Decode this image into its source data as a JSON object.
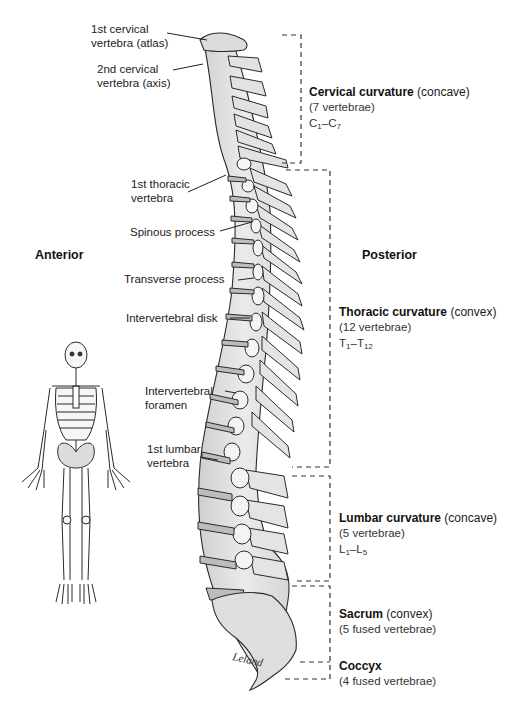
{
  "figure": {
    "orientation": {
      "left": "Anterior",
      "right": "Posterior"
    },
    "signature": "Leland",
    "left_labels": [
      {
        "id": "atlas",
        "lines": [
          "1st cervical",
          "vertebra (atlas)"
        ]
      },
      {
        "id": "axis",
        "lines": [
          "2nd cervical",
          "vertebra (axis)"
        ]
      },
      {
        "id": "first-thoracic",
        "lines": [
          "1st thoracic",
          "vertebra"
        ]
      },
      {
        "id": "spinous-process",
        "lines": [
          "Spinous process"
        ]
      },
      {
        "id": "transverse-process",
        "lines": [
          "Transverse process"
        ]
      },
      {
        "id": "intervertebral-disk",
        "lines": [
          "Intervertebral disk"
        ]
      },
      {
        "id": "intervertebral-foramen",
        "lines": [
          "Intervertebral",
          "foramen"
        ]
      },
      {
        "id": "first-lumbar",
        "lines": [
          "1st lumbar",
          "vertebra"
        ]
      }
    ],
    "regions": [
      {
        "id": "cervical",
        "name": "Cervical curvature",
        "qualifier": " (concave)",
        "count": "(7 vertebrae)",
        "range_letter": "C",
        "range_start": "1",
        "range_end": "7"
      },
      {
        "id": "thoracic",
        "name": "Thoracic curvature",
        "qualifier": " (convex)",
        "count": "(12 vertebrae)",
        "range_letter": "T",
        "range_start": "1",
        "range_end": "12"
      },
      {
        "id": "lumbar",
        "name": "Lumbar curvature",
        "qualifier": " (concave)",
        "count": "(5 vertebrae)",
        "range_letter": "L",
        "range_start": "1",
        "range_end": "5"
      },
      {
        "id": "sacrum",
        "name": "Sacrum",
        "qualifier": " (convex)",
        "count": "(5 fused vertebrae)"
      },
      {
        "id": "coccyx",
        "name": "Coccyx",
        "qualifier": "",
        "count": "(4 fused vertebrae)"
      }
    ],
    "colors": {
      "bone_fill": "#e4e4e4",
      "bone_shade": "#c8c8c8",
      "outline": "#2a2a2a",
      "bracket": "#333333",
      "text": "#222222"
    }
  }
}
